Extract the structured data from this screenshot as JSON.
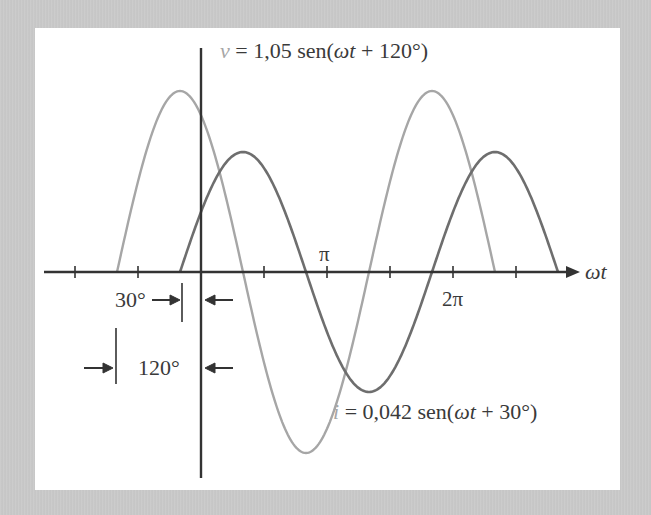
{
  "chart_data": {
    "type": "line",
    "title": "",
    "xlabel": "ωt",
    "ylabel": "",
    "x_unit": "degrees",
    "x_ticks": [
      {
        "deg": -180,
        "label": ""
      },
      {
        "deg": -90,
        "label": ""
      },
      {
        "deg": 90,
        "label": ""
      },
      {
        "deg": 180,
        "label": "π"
      },
      {
        "deg": 270,
        "label": ""
      },
      {
        "deg": 360,
        "label": "2π"
      },
      {
        "deg": 450,
        "label": ""
      }
    ],
    "grid": false,
    "series": [
      {
        "name": "v",
        "equation": "v = 1,05 sen(ωt + 120°)",
        "amplitude": 1.05,
        "phase_deg": 120,
        "x_range_deg": [
          -120,
          420
        ],
        "color": "#a6a6a6"
      },
      {
        "name": "i",
        "equation": "i = 0,042 sen(ωt + 30°)",
        "amplitude": 0.042,
        "phase_deg": 30,
        "x_range_deg": [
          -30,
          510
        ],
        "color": "#6e6e6e"
      }
    ],
    "annotations": [
      {
        "text": "30°",
        "meaning": "current leads by 30° (zero crossing at ωt = -30°)"
      },
      {
        "text": "120°",
        "meaning": "voltage leads by 120° (zero crossing at ωt = -120°)"
      }
    ]
  },
  "labels": {
    "v_var": "v",
    "v_rest": " = 1,05 sen(",
    "v_wt": "ωt",
    "v_tail": " + 120°)",
    "i_var": "i",
    "i_rest": " = 0,042 sen(",
    "i_wt": "ωt",
    "i_tail": " + 30°)",
    "pi": "π",
    "two_pi": "2π",
    "axis": "ωt",
    "angle_30": "30°",
    "angle_120": "120°"
  },
  "layout": {
    "origin_x": 201,
    "axis_y": 272,
    "px_per_deg": 0.7,
    "v_amp_px": 181,
    "i_amp_px": 120,
    "axis_x_start": 44,
    "axis_x_end": 580,
    "yaxis_top": 48,
    "yaxis_bottom": 478,
    "axis_color": "#333333"
  }
}
